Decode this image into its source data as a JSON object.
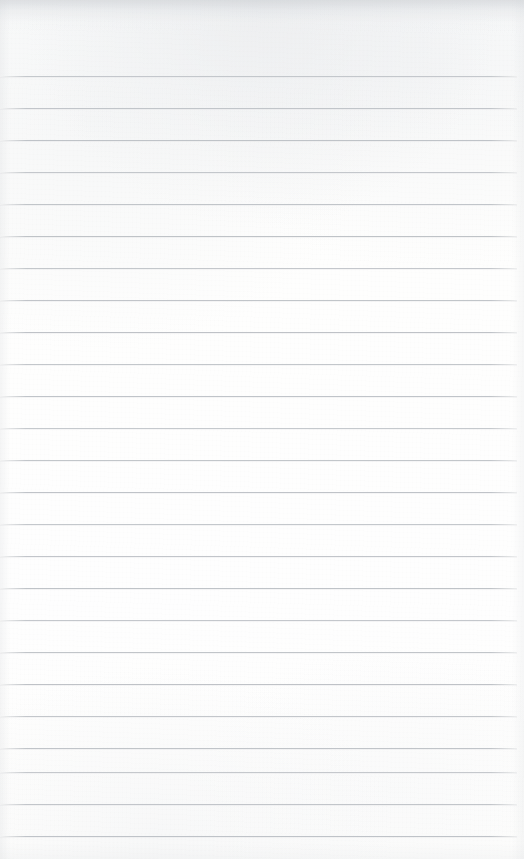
{
  "page": {
    "kind": "lined-notepad-page",
    "content_text": "",
    "width": 524,
    "height": 859,
    "background_color": "#fdfdfc",
    "top_edge_shadow_color": "#c4c8cd"
  },
  "ruling": {
    "line_color": "#b9bdc2",
    "line_thickness_px": 1,
    "line_spacing_px": 32,
    "first_line_y": 76,
    "last_line_y": 836,
    "line_start_x": 0,
    "line_end_x": 517,
    "line_count": 25,
    "lines": [
      {
        "y": 76,
        "x_start": 0,
        "x_end": 517
      },
      {
        "y": 108,
        "x_start": 0,
        "x_end": 517
      },
      {
        "y": 140,
        "x_start": 0,
        "x_end": 517
      },
      {
        "y": 172,
        "x_start": 0,
        "x_end": 517
      },
      {
        "y": 204,
        "x_start": 0,
        "x_end": 517
      },
      {
        "y": 236,
        "x_start": 0,
        "x_end": 517
      },
      {
        "y": 268,
        "x_start": 0,
        "x_end": 517
      },
      {
        "y": 300,
        "x_start": 0,
        "x_end": 517
      },
      {
        "y": 332,
        "x_start": 0,
        "x_end": 517
      },
      {
        "y": 364,
        "x_start": 0,
        "x_end": 517
      },
      {
        "y": 396,
        "x_start": 0,
        "x_end": 517
      },
      {
        "y": 428,
        "x_start": 0,
        "x_end": 517
      },
      {
        "y": 460,
        "x_start": 0,
        "x_end": 517
      },
      {
        "y": 492,
        "x_start": 0,
        "x_end": 517
      },
      {
        "y": 524,
        "x_start": 0,
        "x_end": 517
      },
      {
        "y": 556,
        "x_start": 0,
        "x_end": 517
      },
      {
        "y": 588,
        "x_start": 0,
        "x_end": 517
      },
      {
        "y": 620,
        "x_start": 0,
        "x_end": 517
      },
      {
        "y": 652,
        "x_start": 0,
        "x_end": 517
      },
      {
        "y": 684,
        "x_start": 0,
        "x_end": 517
      },
      {
        "y": 716,
        "x_start": 0,
        "x_end": 517
      },
      {
        "y": 748,
        "x_start": 0,
        "x_end": 517
      },
      {
        "y": 772,
        "x_start": 0,
        "x_end": 517
      },
      {
        "y": 804,
        "x_start": 0,
        "x_end": 517
      },
      {
        "y": 836,
        "x_start": 0,
        "x_end": 517
      }
    ]
  }
}
